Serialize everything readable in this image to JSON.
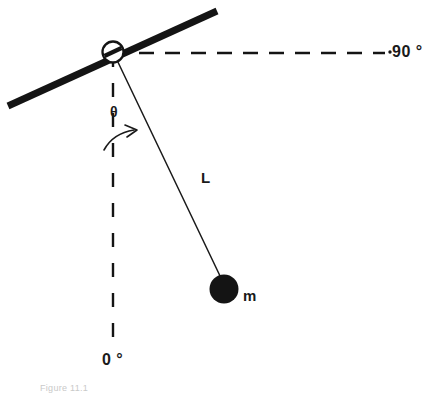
{
  "figure": {
    "type": "physics-diagram",
    "background_color": "#ffffff",
    "ink_color": "#1a1a1a",
    "caption": "Figure 11.1"
  },
  "labels": {
    "angle_max": "90 °",
    "angle_zero": "0 °",
    "angle_variable": "θ",
    "length": "L",
    "mass": "m"
  },
  "elements": {
    "support_bar": {
      "name": "support-bar",
      "x1": 8,
      "y1": 106,
      "x2": 217,
      "y2": 11,
      "stroke_width": 7,
      "color": "#141414"
    },
    "pivot": {
      "name": "pivot-hinge",
      "cx": 113,
      "cy": 52,
      "r": 10.5,
      "stroke_width": 2.2,
      "fill": "#ffffff",
      "color": "#141414"
    },
    "horizontal_reference": {
      "name": "horizontal-reference-line",
      "x1": 113,
      "y1": 53,
      "x2": 388,
      "y2": 53,
      "dash": "14 10",
      "stroke_width": 2.4,
      "color": "#141414"
    },
    "vertical_reference": {
      "name": "vertical-reference-line",
      "x1": 113,
      "y1": 53,
      "x2": 113,
      "y2": 344,
      "dash": "14 16",
      "stroke_width": 2.4,
      "color": "#141414"
    },
    "rod": {
      "name": "pendulum-rod",
      "x1": 116,
      "y1": 58,
      "x2": 221,
      "y2": 278,
      "stroke_width": 1.4,
      "color": "#1a1a1a"
    },
    "bob": {
      "name": "pendulum-bob",
      "cx": 224,
      "cy": 289,
      "r": 14.5,
      "fill": "#141414"
    },
    "angle_arrow": {
      "name": "angle-sweep-arrow",
      "path": "M 105 150 C 112 139 124 132 136 130",
      "stroke_width": 1.6,
      "color": "#1a1a1a",
      "arrow_tip": [
        136,
        130
      ]
    },
    "dot_before_90": {
      "name": "tick-dot",
      "cx": 390,
      "cy": 52,
      "r": 1.6,
      "fill": "#141414"
    }
  },
  "geometry": {
    "pendulum_angle_from_vertical_deg": 25.5,
    "support_bar_angle_deg": -24.5,
    "rod_length_px": 243
  }
}
